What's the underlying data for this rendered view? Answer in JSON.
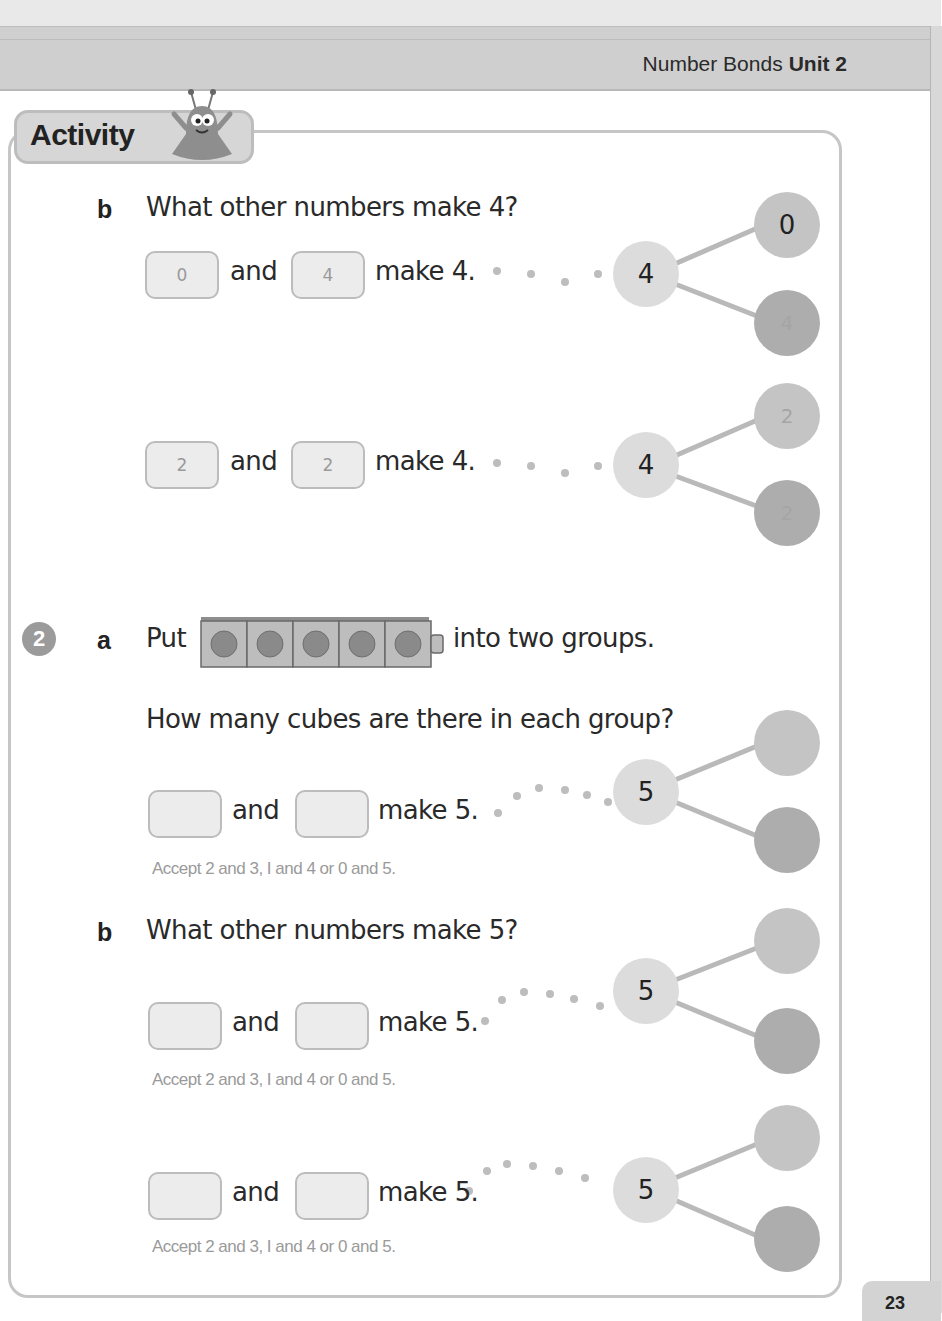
{
  "header": {
    "unit_title": "Number Bonds",
    "unit_label": "Unit 2"
  },
  "activity": {
    "label": "Activity"
  },
  "question1": {
    "part_b": {
      "letter": "b",
      "prompt": "What other numbers make 4?",
      "rows": [
        {
          "box1": "0",
          "and": "and",
          "box2": "4",
          "tail": "make 4.",
          "whole": "4",
          "part_top": "0",
          "part_bottom": "4"
        },
        {
          "box1": "2",
          "and": "and",
          "box2": "2",
          "tail": "make 4.",
          "whole": "4",
          "part_top": "2",
          "part_bottom": "2"
        }
      ]
    }
  },
  "question2": {
    "number": "2",
    "part_a": {
      "letter": "a",
      "prompt_before": "Put",
      "prompt_after": "into two groups.",
      "cube_count": 5,
      "subprompt": "How many cubes are there in each group?",
      "row": {
        "box1": "",
        "and": "and",
        "box2": "",
        "tail": "make 5.",
        "whole": "5",
        "part_top": "",
        "part_bottom": ""
      },
      "note": "Accept 2 and 3, I and 4 or 0 and 5."
    },
    "part_b": {
      "letter": "b",
      "prompt": "What other numbers make 5?",
      "rows": [
        {
          "box1": "",
          "and": "and",
          "box2": "",
          "tail": "make 5.",
          "whole": "5",
          "part_top": "",
          "part_bottom": "",
          "note": "Accept 2 and 3, I and 4 or 0 and 5."
        },
        {
          "box1": "",
          "and": "and",
          "box2": "",
          "tail": "make 5.",
          "whole": "5",
          "part_top": "",
          "part_bottom": "",
          "note": "Accept 2 and 3, I and 4 or 0 and 5."
        }
      ]
    }
  },
  "footer": {
    "page_number": "23"
  },
  "colors": {
    "whole_node": "#dcdcdc",
    "part_top": "#c4c4c4",
    "part_bottom": "#adadad",
    "answer_text": "#9a9a9a"
  }
}
